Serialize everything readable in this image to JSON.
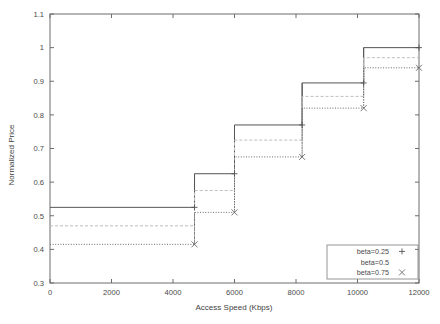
{
  "chart_data": {
    "type": "line",
    "title": "",
    "subtitle": "",
    "xlabel": "Access Speed (Kbps)",
    "ylabel": "Normalized Price",
    "xlim": [
      0,
      12000
    ],
    "ylim": [
      0.3,
      1.1
    ],
    "xticks": [
      0,
      2000,
      4000,
      6000,
      8000,
      10000,
      12000
    ],
    "xtick_labels": [
      "0",
      "2000",
      "4000",
      "6000",
      "8000",
      "10000",
      "12000"
    ],
    "yticks": [
      0.3,
      0.4,
      0.5,
      0.6,
      0.7,
      0.8,
      0.9,
      1.0,
      1.1
    ],
    "ytick_labels": [
      "0.3",
      "0.4",
      "0.5",
      "0.6",
      "0.7",
      "0.8",
      "0.9",
      "1",
      "1.1"
    ],
    "grid": false,
    "drawstyle": "steps-post",
    "legend_position": "lower-right",
    "step_edges": [
      0,
      4700,
      6000,
      8200,
      10200,
      12000
    ],
    "series": [
      {
        "name": "beta=0.25",
        "marker": "+",
        "linestyle": "solid",
        "color": "#555555",
        "values": [
          0.525,
          0.625,
          0.77,
          0.895,
          1.0
        ],
        "marker_x": [
          4700,
          6000,
          8200,
          10200,
          12000
        ],
        "marker_y": [
          0.525,
          0.625,
          0.77,
          0.895,
          1.0
        ]
      },
      {
        "name": "beta=0.5",
        "marker": "",
        "linestyle": "dashed",
        "color": "#bdbdbd",
        "values": [
          0.47,
          0.575,
          0.725,
          0.855,
          0.97
        ],
        "marker_x": [
          4700,
          6000,
          8200,
          10200,
          12000
        ],
        "marker_y": [
          0.47,
          0.575,
          0.725,
          0.855,
          0.97
        ]
      },
      {
        "name": "beta=0.75",
        "marker": "x",
        "linestyle": "dotted",
        "color": "#6a6a6a",
        "values": [
          0.415,
          0.51,
          0.675,
          0.82,
          0.94
        ],
        "marker_x": [
          4700,
          6000,
          8200,
          10200,
          12000
        ],
        "marker_y": [
          0.415,
          0.51,
          0.675,
          0.82,
          0.94
        ]
      }
    ]
  },
  "legend": {
    "entries": [
      {
        "label": "beta=0.25"
      },
      {
        "label": "beta=0.5"
      },
      {
        "label": "beta=0.75"
      }
    ]
  },
  "axes": {
    "x_title": "Access Speed (Kbps)",
    "y_title": "Normalized Price"
  }
}
